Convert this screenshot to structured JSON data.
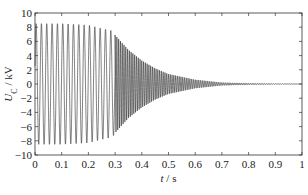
{
  "chart_data": {
    "type": "line",
    "title": "",
    "xlabel": "t / s",
    "ylabel": "U_C / kV",
    "xlim": [
      0,
      1
    ],
    "ylim": [
      -10,
      10
    ],
    "xticks": [
      0,
      0.1,
      0.2,
      0.3,
      0.4,
      0.5,
      0.6,
      0.7,
      0.8,
      0.9,
      1
    ],
    "xtick_labels": [
      "0",
      "0.1",
      "0.2",
      "0.3",
      "0.4",
      "0.5",
      "0.6",
      "0.7",
      "0.8",
      "0.9",
      "1"
    ],
    "yticks": [
      -10,
      -8,
      -6,
      -4,
      -2,
      0,
      2,
      4,
      6,
      8,
      10
    ],
    "ytick_labels": [
      "-10",
      "-8",
      "-6",
      "-4",
      "-2",
      "0",
      "2",
      "4",
      "6",
      "8",
      "10"
    ],
    "grid": false,
    "legend": null,
    "series": [
      {
        "name": "U_C",
        "description": "Oscillating capacitor voltage; ~8.5 kV amplitude at ~50 Hz until ~0.2 s, slowly decaying to ~7.5 kV by 0.29 s, then switching at ~0.3 s to a higher-frequency oscillation whose envelope decays exponentially to ~0 by ~0.7 s and stays flat at 0 through 1 s.",
        "envelope": {
          "t": [
            0,
            0.1,
            0.2,
            0.25,
            0.29,
            0.3,
            0.35,
            0.4,
            0.45,
            0.5,
            0.6,
            0.7,
            0.8,
            0.9,
            1.0
          ],
          "amplitude_kV": [
            8.5,
            8.5,
            8.3,
            7.8,
            7.5,
            6.9,
            4.8,
            3.3,
            2.2,
            1.4,
            0.6,
            0.2,
            0.1,
            0.05,
            0.0
          ]
        },
        "segments": [
          {
            "t_start": 0,
            "t_end": 0.3,
            "approx_cycles": 15,
            "approx_frequency_Hz": 50
          },
          {
            "t_start": 0.3,
            "t_end": 1.0,
            "approx_frequency_Hz": 150,
            "decaying": true
          }
        ]
      }
    ]
  },
  "axes": {
    "x_label_italic": "t",
    "x_label_unit": " / s",
    "y_label_main": "U",
    "y_label_sub": "C",
    "y_label_unit": " / kV"
  },
  "colors": {
    "line": "#1a1a1a",
    "axis": "#333333",
    "background": "#ffffff"
  }
}
